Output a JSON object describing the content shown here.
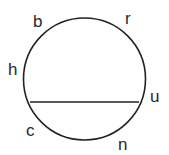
{
  "diagram": {
    "type": "circle-with-chord",
    "background": "#ffffff",
    "stroke_color": "#222222",
    "label_color": "#2a2a2a",
    "circle": {
      "cx": 84.5,
      "cy": 79,
      "r": 61
    },
    "chord": {
      "x1": 30,
      "y1": 102,
      "x2": 139,
      "y2": 102
    },
    "labels": [
      {
        "text": "b",
        "x": 33,
        "y": 27
      },
      {
        "text": "r",
        "x": 125,
        "y": 24
      },
      {
        "text": "h",
        "x": 8,
        "y": 75
      },
      {
        "text": "u",
        "x": 150,
        "y": 102
      },
      {
        "text": "c",
        "x": 26,
        "y": 136
      },
      {
        "text": "n",
        "x": 118,
        "y": 150
      }
    ]
  }
}
